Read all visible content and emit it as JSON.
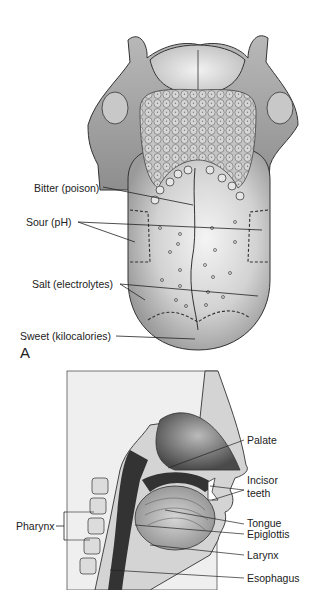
{
  "figure": {
    "panel_a": {
      "letter": "A",
      "subject": "Dorsal view of tongue with taste regions",
      "labels": [
        {
          "id": "bitter",
          "text": "Bitter (poison)"
        },
        {
          "id": "sour",
          "text": "Sour (pH)"
        },
        {
          "id": "salt",
          "text": "Salt (electrolytes)"
        },
        {
          "id": "sweet",
          "text": "Sweet (kilocalories)"
        }
      ]
    },
    "panel_b": {
      "subject": "Sagittal section of head and neck",
      "labels": [
        {
          "id": "palate",
          "text": "Palate"
        },
        {
          "id": "incisor",
          "text": "Incisor\nteeth",
          "line1": "Incisor",
          "line2": "teeth"
        },
        {
          "id": "tongue",
          "text": "Tongue"
        },
        {
          "id": "epiglottis",
          "text": "Epiglottis"
        },
        {
          "id": "larynx",
          "text": "Larynx"
        },
        {
          "id": "esophagus",
          "text": "Esophagus"
        },
        {
          "id": "pharynx",
          "text": "Pharynx"
        }
      ]
    }
  }
}
